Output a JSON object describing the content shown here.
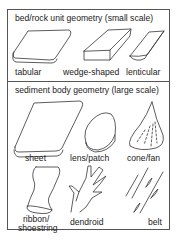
{
  "sections": [
    {
      "title": "bed/rock unit geometry (small scale)",
      "items": [
        {
          "label": "tabular",
          "icon": "tabular-slab-icon"
        },
        {
          "label": "wedge-shaped",
          "icon": "wedge-block-icon"
        },
        {
          "label": "lenticular",
          "icon": "lenticular-body-icon"
        }
      ]
    },
    {
      "title": "sediment body geometry (large scale)",
      "items": [
        {
          "label": "sheet",
          "icon": "sheet-slab-icon"
        },
        {
          "label": "lens/patch",
          "icon": "lens-patch-icon"
        },
        {
          "label": "cone/fan",
          "icon": "cone-fan-icon"
        },
        {
          "label": "ribbon/",
          "label2": "shoestring",
          "icon": "ribbon-shoestring-icon"
        },
        {
          "label": "dendroid",
          "icon": "dendroid-icon"
        },
        {
          "label": "belt",
          "icon": "belt-icon"
        }
      ]
    }
  ],
  "colors": {
    "stroke": "#333333",
    "border": "#555555",
    "background": "#ffffff"
  }
}
